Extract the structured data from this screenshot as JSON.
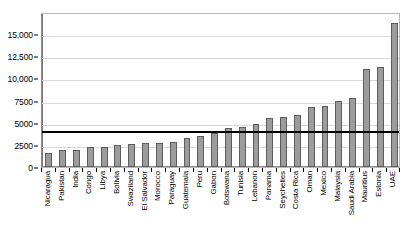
{
  "chart_data": {
    "type": "bar",
    "title": "",
    "subtitle": "",
    "xlabel": "",
    "ylabel": "",
    "ylim": [
      0,
      17500
    ],
    "grid": true,
    "legend": "none",
    "y_ticks": [
      {
        "value": 0,
        "label": "0"
      },
      {
        "value": 2500,
        "label": "2500"
      },
      {
        "value": 5000,
        "label": "5000"
      },
      {
        "value": 7500,
        "label": "7500"
      },
      {
        "value": 10000,
        "label": "10,000"
      },
      {
        "value": 12500,
        "label": "12,500"
      },
      {
        "value": 15000,
        "label": "15,000"
      }
    ],
    "categories": [
      "Nicaragua",
      "Pakistan",
      "India",
      "Congo",
      "Libya",
      "Bolivia",
      "Swaziland",
      "El Salvador",
      "Morocco",
      "Paraguay",
      "Guatemala",
      "Peru",
      "Gabon",
      "Botswana",
      "Tunisia",
      "Lebanon",
      "Panama",
      "Seychelles",
      "Costa Rica",
      "Oman",
      "Mexico",
      "Malaysia",
      "Saudi Arabia",
      "Mauritius",
      "Estonia",
      "UAE"
    ],
    "values": [
      1600,
      1950,
      1930,
      2250,
      2250,
      2530,
      2560,
      2680,
      2720,
      2820,
      3300,
      3520,
      3800,
      4350,
      4500,
      4900,
      5550,
      5600,
      5880,
      6720,
      6850,
      7500,
      7780,
      11050,
      11250,
      16250
    ],
    "bar_color": "#9c9c9c",
    "bar_border_color": "#5d5d5d",
    "gridline_color": "#d9d9d9",
    "reference_line": {
      "value": 4286,
      "color": "#000000",
      "label": ""
    }
  }
}
